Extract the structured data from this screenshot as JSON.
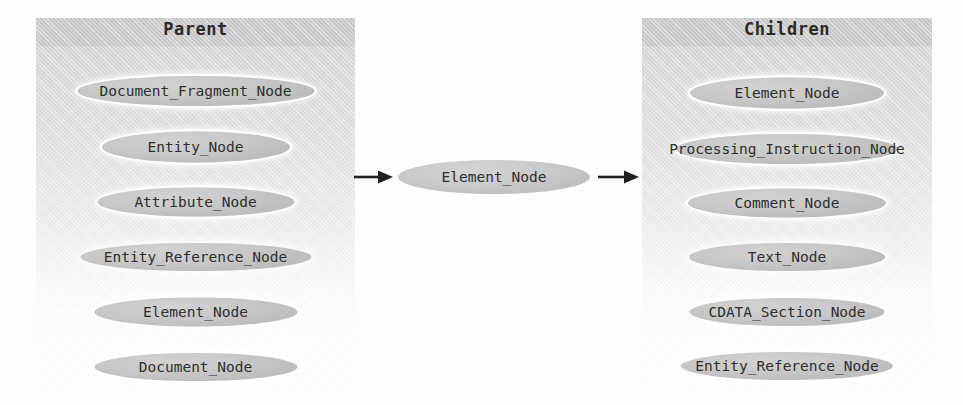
{
  "diagram": {
    "background_color": "#fdfdfd",
    "node_fill_color": "#c7c7c7",
    "text_color": "#2e2e2e",
    "header_band_color": "#c9c9c9"
  },
  "parent_panel": {
    "title": "Parent",
    "nodes": [
      {
        "label": "Document_Fragment_Node",
        "style": "halo"
      },
      {
        "label": "Entity_Node",
        "style": "halo"
      },
      {
        "label": "Attribute_Node",
        "style": "halo"
      },
      {
        "label": "Entity_Reference_Node",
        "style": "soft"
      },
      {
        "label": "Element_Node",
        "style": "soft"
      },
      {
        "label": "Document_Node",
        "style": "soft"
      }
    ]
  },
  "center": {
    "label": "Element_Node",
    "arrow_in": "arrow-right-glyph",
    "arrow_out": "arrow-right-glyph"
  },
  "children_panel": {
    "title": "Children",
    "nodes": [
      {
        "label": "Element_Node",
        "style": "halo"
      },
      {
        "label": "Processing_Instruction_Node",
        "style": "halo"
      },
      {
        "label": "Comment_Node",
        "style": "halo"
      },
      {
        "label": "Text_Node",
        "style": "soft"
      },
      {
        "label": "CDATA_Section_Node",
        "style": "soft"
      },
      {
        "label": "Entity_Reference_Node",
        "style": "soft"
      }
    ]
  }
}
